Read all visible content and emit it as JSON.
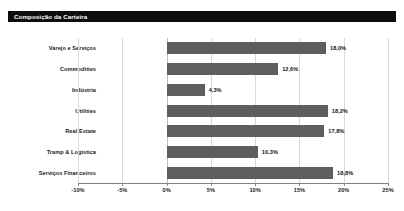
{
  "header": {
    "title": "Composição da Carteira",
    "bar_color": "#0d0d0d",
    "text_color": "#ffffff"
  },
  "chart_data": {
    "type": "bar",
    "orientation": "horizontal",
    "title": "Composição da Carteira",
    "xlabel": "",
    "ylabel": "",
    "categories": [
      "Varejo e Serviços",
      "Commodities",
      "Indústria",
      "Utilities",
      "Real Estate",
      "Tramp & Logística",
      "Serviços Financeiros"
    ],
    "values": [
      18.0,
      12.6,
      4.3,
      18.2,
      17.8,
      10.3,
      18.8
    ],
    "value_labels": [
      "18,0%",
      "12,6%",
      "4,3%",
      "18,2%",
      "17,8%",
      "10,3%",
      "18,8%"
    ],
    "xlim": [
      -10,
      25
    ],
    "xticks": [
      -10,
      -5,
      0,
      5,
      10,
      15,
      20,
      25
    ],
    "xtick_labels": [
      "-10%",
      "-5%",
      "0%",
      "5%",
      "10%",
      "15%",
      "20%",
      "25%"
    ],
    "grid": true,
    "legend": false,
    "series_color": "#5e5e5e"
  }
}
